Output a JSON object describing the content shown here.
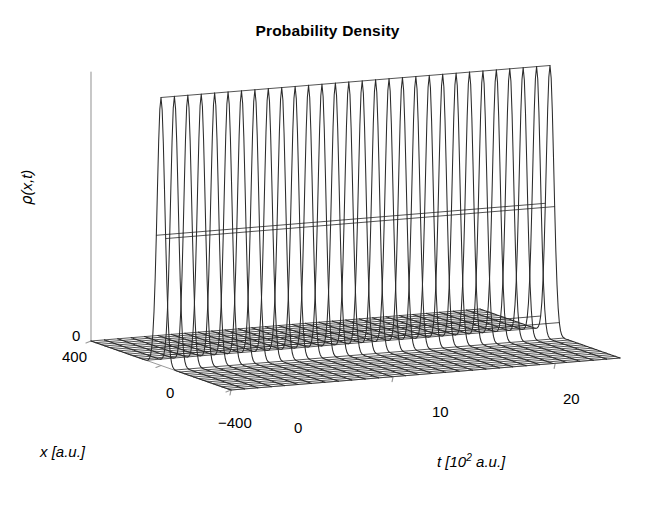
{
  "figure": {
    "title": "Probability Density",
    "background_color": "#ffffff",
    "line_color": "#2b2b2b",
    "axis_color": "#9a9a9a"
  },
  "axes": {
    "z": {
      "label_rho": "ρ",
      "label_args": "(x,t)",
      "ticks": [
        "0"
      ]
    },
    "x": {
      "title_var": "x",
      "title_units": "[a.u.]",
      "ticks": [
        "400",
        "0",
        "−400"
      ]
    },
    "t": {
      "title_var": "t",
      "title_units_pre": "[10",
      "title_units_exp": "2",
      "title_units_post": " a.u.]",
      "ticks": [
        "0",
        "10",
        "20"
      ]
    }
  },
  "chart_data": {
    "type": "line",
    "subtype": "3d-waterfall-mesh",
    "title": "Probability Density",
    "xlabel": "x [a.u.]",
    "ylabel": "t [10^2 a.u.]",
    "zlabel": "rho(x,t)",
    "xlim": [
      -400,
      400
    ],
    "ylim": [
      0,
      24
    ],
    "zlim": [
      0,
      1
    ],
    "x_ticks": [
      400,
      0,
      -400
    ],
    "x_tick_labels": [
      "400",
      "0",
      "-400"
    ],
    "t_ticks": [
      0,
      10,
      20
    ],
    "t_tick_labels": [
      "0",
      "10",
      "20"
    ],
    "z_ticks": [
      0
    ],
    "z_tick_labels": [
      "0"
    ],
    "grid": false,
    "legend": null,
    "n_time_slices": 30,
    "n_x_samples": 121,
    "series_description": "Each time slice is a single narrow Gaussian wavepacket of near-constant amplitude and width, centered near x = 0, plotted as a waterfall of traces versus t.",
    "peak_center_x": 0,
    "peak_width_sigma": 22,
    "peak_amplitude": 1.0,
    "t_values": [
      0,
      0.8276,
      1.6552,
      2.4828,
      3.3103,
      4.1379,
      4.9655,
      5.7931,
      6.6207,
      7.4483,
      8.2759,
      9.1034,
      9.931,
      10.7586,
      11.5862,
      12.4138,
      13.2414,
      14.069,
      14.8966,
      15.7241,
      16.5517,
      17.3793,
      18.2069,
      19.0345,
      19.8621,
      20.6897,
      21.5172,
      22.3448,
      23.1724,
      24
    ],
    "amplitudes": [
      1.0,
      1.0,
      1.0,
      1.0,
      1.0,
      1.0,
      1.0,
      1.0,
      1.0,
      1.0,
      1.0,
      1.0,
      1.0,
      1.0,
      1.0,
      1.0,
      1.0,
      1.0,
      1.0,
      1.0,
      1.0,
      1.0,
      1.0,
      1.0,
      1.0,
      1.0,
      1.0,
      1.0,
      1.0,
      1.0
    ],
    "centers": [
      0,
      0,
      0,
      0,
      0,
      0,
      0,
      0,
      0,
      0,
      0,
      0,
      0,
      0,
      0,
      0,
      0,
      0,
      0,
      0,
      0,
      0,
      0,
      0,
      0,
      0,
      0,
      0,
      0,
      0
    ]
  },
  "projection": {
    "origin_x": 91,
    "origin_y": 341,
    "x_axis_dx": 140,
    "x_axis_dy": 49,
    "t_axis_dx": 389,
    "t_axis_dy": -32,
    "z_axis_dy": -268
  }
}
